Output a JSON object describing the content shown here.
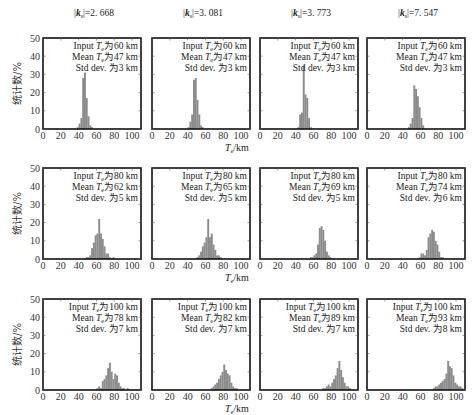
{
  "figure": {
    "column_titles": [
      "|k_s|=2. 668",
      "|k_s|=3. 081",
      "|k_s|=3. 773",
      "|k_s|=7. 547"
    ],
    "column_title_parts": [
      {
        "prefix": "|",
        "k": "k",
        "sub": "s",
        "suffix": "|=2. 668"
      },
      {
        "prefix": "|",
        "k": "k",
        "sub": "s",
        "suffix": "|=3. 081"
      },
      {
        "prefix": "|",
        "k": "k",
        "sub": "s",
        "suffix": "|=3. 773"
      },
      {
        "prefix": "|",
        "k": "k",
        "sub": "s",
        "suffix": "|=7. 547"
      }
    ],
    "ylabel": "统计数/%",
    "xlabel": "T_e/km",
    "xlabel_main": "T",
    "xlabel_sub": "e",
    "xlabel_unit": "/km",
    "xticks": [
      0,
      20,
      40,
      60,
      80,
      100
    ],
    "yticks": [
      0,
      10,
      20,
      30,
      40,
      50
    ],
    "bar_color": "#8c8c8c"
  },
  "chart_data": [
    {
      "type": "bar",
      "title": "|k_s|=2.668, Input Te 60 km",
      "row": 0,
      "col": 0,
      "annotation": [
        "Input T_e为60  km",
        "Mean  T_e为47  km",
        "Std  dev. 为3  km"
      ],
      "input_te": 60,
      "mean_te": 47,
      "std_dev": 3,
      "xlabel": "T_e/km",
      "ylabel": "统计数/%",
      "xlim": [
        0,
        110
      ],
      "ylim": [
        0,
        50
      ],
      "bins": [
        38,
        40,
        42,
        44,
        46,
        48,
        50,
        52,
        54,
        56
      ],
      "values": [
        1,
        3,
        6,
        28,
        31,
        17,
        7,
        2,
        1,
        0
      ]
    },
    {
      "type": "bar",
      "title": "|k_s|=3.081, Input Te 60 km",
      "row": 0,
      "col": 1,
      "annotation": [
        "Input T_e为60  km",
        "Mean  T_e为47  km",
        "Std  dev. 为3  km"
      ],
      "input_te": 60,
      "mean_te": 47,
      "std_dev": 3,
      "xlabel": "T_e/km",
      "ylabel": "统计数/%",
      "xlim": [
        0,
        110
      ],
      "ylim": [
        0,
        50
      ],
      "bins": [
        40,
        42,
        44,
        46,
        48,
        50,
        52,
        54,
        56,
        58
      ],
      "values": [
        1,
        4,
        8,
        27,
        28,
        16,
        8,
        2,
        1,
        0
      ]
    },
    {
      "type": "bar",
      "title": "|k_s|=3.773, Input Te 60 km",
      "row": 0,
      "col": 2,
      "annotation": [
        "Input T_e为60  km",
        "Mean  T_e为47  km",
        "Std  dev. 为3  km"
      ],
      "input_te": 60,
      "mean_te": 47,
      "std_dev": 3,
      "xlabel": "T_e/km",
      "ylabel": "统计数/%",
      "xlim": [
        0,
        110
      ],
      "ylim": [
        0,
        50
      ],
      "bins": [
        42,
        44,
        46,
        48,
        50,
        52,
        54,
        56,
        58,
        60
      ],
      "values": [
        1,
        8,
        9,
        35,
        19,
        17,
        6,
        1,
        0,
        0
      ]
    },
    {
      "type": "bar",
      "title": "|k_s|=7.547, Input Te 60 km",
      "row": 0,
      "col": 3,
      "annotation": [
        "Input T_e为60  km",
        "Mean  T_e为47  km",
        "Std  dev. 为3  km"
      ],
      "input_te": 60,
      "mean_te": 47,
      "std_dev": 3,
      "xlabel": "T_e/km",
      "ylabel": "统计数/%",
      "xlim": [
        0,
        110
      ],
      "ylim": [
        0,
        50
      ],
      "bins": [
        46,
        48,
        50,
        52,
        54,
        56,
        58,
        60,
        62,
        64
      ],
      "values": [
        1,
        3,
        6,
        24,
        22,
        18,
        12,
        6,
        2,
        0
      ]
    },
    {
      "type": "bar",
      "title": "|k_s|=2.668, Input Te 80 km",
      "row": 1,
      "col": 0,
      "annotation": [
        "Input T_e为80  km",
        "Mean  T_e为62  km",
        "Std  dev. 为5  km"
      ],
      "input_te": 80,
      "mean_te": 62,
      "std_dev": 5,
      "xlabel": "T_e/km",
      "ylabel": "统计数/%",
      "xlim": [
        0,
        110
      ],
      "ylim": [
        0,
        50
      ],
      "bins": [
        48,
        50,
        52,
        54,
        56,
        58,
        60,
        62,
        64,
        66,
        68,
        70,
        72,
        74,
        76,
        78,
        80
      ],
      "values": [
        1,
        1,
        2,
        6,
        9,
        13,
        14,
        22,
        14,
        11,
        7,
        3,
        3,
        1,
        0,
        1,
        0
      ]
    },
    {
      "type": "bar",
      "title": "|k_s|=3.081, Input Te 80 km",
      "row": 1,
      "col": 1,
      "annotation": [
        "Input T_e为80  km",
        "Mean  T_e为65  km",
        "Std  dev. 为5  km"
      ],
      "input_te": 80,
      "mean_te": 65,
      "std_dev": 5,
      "xlabel": "T_e/km",
      "ylabel": "统计数/%",
      "xlim": [
        0,
        110
      ],
      "ylim": [
        0,
        50
      ],
      "bins": [
        50,
        52,
        54,
        56,
        58,
        60,
        62,
        64,
        66,
        68,
        70,
        72,
        74,
        76,
        78
      ],
      "values": [
        1,
        2,
        4,
        7,
        9,
        12,
        22,
        12,
        14,
        8,
        5,
        2,
        2,
        1,
        0
      ]
    },
    {
      "type": "bar",
      "title": "|k_s|=3.773, Input Te 80 km",
      "row": 1,
      "col": 2,
      "annotation": [
        "Input T_e为80  km",
        "Mean  T_e为69  km",
        "Std  dev. 为5  km"
      ],
      "input_te": 80,
      "mean_te": 69,
      "std_dev": 5,
      "xlabel": "T_e/km",
      "ylabel": "统计数/%",
      "xlim": [
        0,
        110
      ],
      "ylim": [
        0,
        50
      ],
      "bins": [
        56,
        58,
        60,
        62,
        64,
        66,
        68,
        70,
        72,
        74,
        76,
        78,
        80
      ],
      "values": [
        1,
        1,
        2,
        3,
        8,
        17,
        18,
        16,
        10,
        4,
        2,
        1,
        0
      ]
    },
    {
      "type": "bar",
      "title": "|k_s|=7.547, Input Te 80 km",
      "row": 1,
      "col": 3,
      "annotation": [
        "Input T_e为80  km",
        "Mean  T_e为74  km",
        "Std  dev. 为6  km"
      ],
      "input_te": 80,
      "mean_te": 74,
      "std_dev": 6,
      "xlabel": "T_e/km",
      "ylabel": "统计数/%",
      "xlim": [
        0,
        110
      ],
      "ylim": [
        0,
        50
      ],
      "bins": [
        58,
        60,
        62,
        64,
        66,
        68,
        70,
        72,
        74,
        76,
        78,
        80,
        82,
        84,
        86
      ],
      "values": [
        1,
        3,
        3,
        2,
        5,
        12,
        14,
        16,
        15,
        10,
        8,
        4,
        1,
        1,
        0
      ]
    },
    {
      "type": "bar",
      "title": "|k_s|=2.668, Input Te 100 km",
      "row": 2,
      "col": 0,
      "annotation": [
        "Input T_e为100  km",
        "Mean  T_e为78  km",
        "Std  dev. 为7  km"
      ],
      "input_te": 100,
      "mean_te": 78,
      "std_dev": 7,
      "xlabel": "T_e/km",
      "ylabel": "统计数/%",
      "xlim": [
        0,
        110
      ],
      "ylim": [
        0,
        50
      ],
      "bins": [
        60,
        62,
        64,
        66,
        68,
        70,
        72,
        74,
        76,
        78,
        80,
        82,
        84,
        86,
        88,
        90,
        92,
        94,
        96
      ],
      "values": [
        1,
        2,
        1,
        5,
        6,
        8,
        12,
        15,
        10,
        6,
        9,
        8,
        4,
        2,
        1,
        1,
        0,
        1,
        0
      ]
    },
    {
      "type": "bar",
      "title": "|k_s|=3.081, Input Te 100 km",
      "row": 2,
      "col": 1,
      "annotation": [
        "Input T_e为100  km",
        "Mean  T_e为82  km",
        "Std  dev. 为7  km"
      ],
      "input_te": 100,
      "mean_te": 82,
      "std_dev": 7,
      "xlabel": "T_e/km",
      "ylabel": "统计数/%",
      "xlim": [
        0,
        110
      ],
      "ylim": [
        0,
        50
      ],
      "bins": [
        66,
        68,
        70,
        72,
        74,
        76,
        78,
        80,
        82,
        84,
        86,
        88,
        90,
        92,
        94,
        96,
        98
      ],
      "values": [
        1,
        2,
        3,
        4,
        6,
        8,
        10,
        14,
        11,
        9,
        8,
        4,
        2,
        1,
        1,
        0,
        0
      ]
    },
    {
      "type": "bar",
      "title": "|k_s|=3.773, Input Te 100 km",
      "row": 2,
      "col": 2,
      "annotation": [
        "Input T_e为100  km",
        "Mean  T_e为89  km",
        "Std  dev. 为7  km"
      ],
      "input_te": 100,
      "mean_te": 89,
      "std_dev": 7,
      "xlabel": "T_e/km",
      "ylabel": "统计数/%",
      "xlim": [
        0,
        110
      ],
      "ylim": [
        0,
        50
      ],
      "bins": [
        70,
        72,
        74,
        76,
        78,
        80,
        82,
        84,
        86,
        88,
        90,
        92,
        94,
        96,
        98,
        100,
        102
      ],
      "values": [
        1,
        1,
        2,
        3,
        2,
        4,
        6,
        8,
        12,
        16,
        11,
        7,
        4,
        2,
        2,
        1,
        0
      ]
    },
    {
      "type": "bar",
      "title": "|k_s|=7.547, Input Te 100 km",
      "row": 2,
      "col": 3,
      "annotation": [
        "Input T_e为100  km",
        "Mean  T_e为93  km",
        "Std  dev. 为8  km"
      ],
      "input_te": 100,
      "mean_te": 93,
      "std_dev": 8,
      "xlabel": "T_e/km",
      "ylabel": "统计数/%",
      "xlim": [
        0,
        110
      ],
      "ylim": [
        0,
        50
      ],
      "bins": [
        74,
        76,
        78,
        80,
        82,
        84,
        86,
        88,
        90,
        92,
        94,
        96,
        98,
        100,
        102,
        104,
        106
      ],
      "values": [
        1,
        2,
        2,
        3,
        4,
        5,
        6,
        9,
        16,
        13,
        12,
        8,
        4,
        3,
        2,
        2,
        1
      ]
    }
  ]
}
